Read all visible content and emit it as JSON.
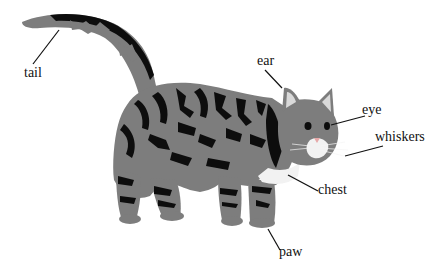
{
  "diagram": {
    "colors": {
      "fur_grey": "#7d7d7d",
      "stripe": "#0d0d0d",
      "white_fur": "#f2f2f2",
      "ear_inner": "#d9d9d9",
      "leader_line": "#111111",
      "label_text": "#111111"
    },
    "labels": [
      {
        "id": "tail",
        "text": "tail"
      },
      {
        "id": "ear",
        "text": "ear"
      },
      {
        "id": "eye",
        "text": "eye"
      },
      {
        "id": "whiskers",
        "text": "whiskers"
      },
      {
        "id": "chest",
        "text": "chest"
      },
      {
        "id": "paw",
        "text": "paw"
      }
    ]
  }
}
